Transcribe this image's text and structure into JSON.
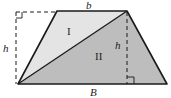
{
  "diagram": {
    "type": "trapezoid-area-decomposition",
    "labels": {
      "top_base": "b",
      "bottom_base": "B",
      "height_left": "h",
      "height_right": "h",
      "region_1": "I",
      "region_2": "II"
    },
    "colors": {
      "region_1_fill": "#e4e4e4",
      "region_2_fill": "#bdbdbd",
      "stroke": "#1a1a1a",
      "background": "#ffffff"
    }
  }
}
